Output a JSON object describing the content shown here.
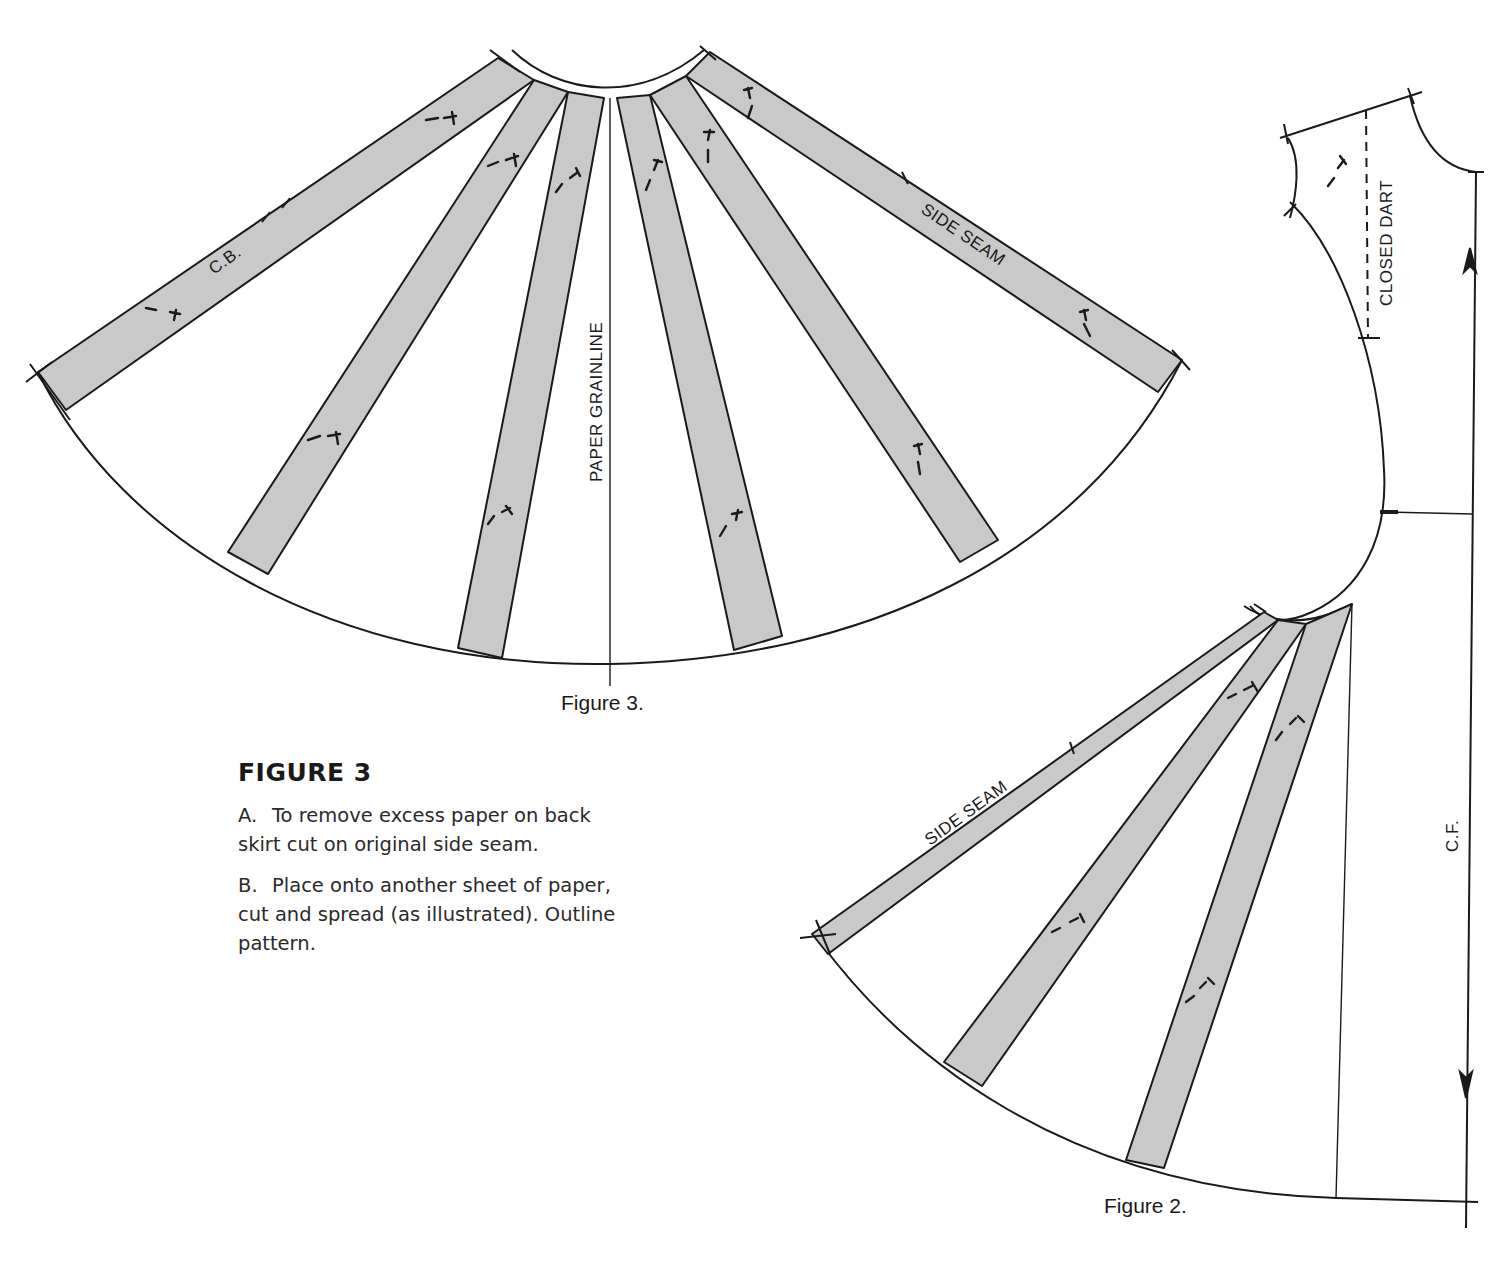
{
  "figure3_diagram": {
    "labels": {
      "cb": "C.B.",
      "side_seam": "SIDE SEAM",
      "paper_grainline": "PAPER GRAINLINE"
    },
    "caption": "Figure 3.",
    "gore_fill": "#c9c9c9",
    "gore_count": 6
  },
  "figure2_diagram": {
    "labels": {
      "closed_dart": "CLOSED DART",
      "side_seam": "SIDE SEAM",
      "cf": "C.F."
    },
    "caption": "Figure 2.",
    "gore_count": 3
  },
  "instructions": {
    "heading": "FIGURE 3",
    "steps": [
      {
        "marker": "A.",
        "text": "To remove excess paper on back skirt cut on original side seam."
      },
      {
        "marker": "B.",
        "text": "Place onto another sheet of paper, cut and spread (as illustrated). Outline pattern."
      }
    ]
  },
  "colors": {
    "ink": "#1a1a1a",
    "gore": "#c9c9c9",
    "paper": "#ffffff"
  }
}
